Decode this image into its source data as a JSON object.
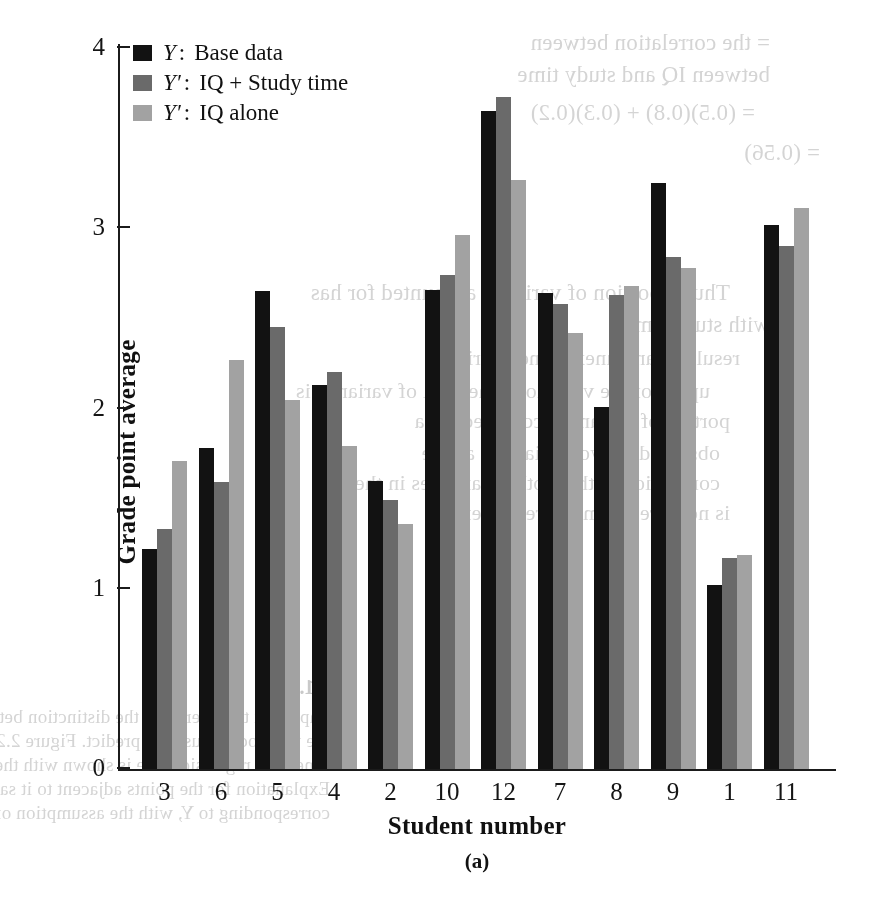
{
  "chart_data": {
    "type": "bar",
    "title": "",
    "panel_caption": "(a)",
    "xlabel": "Student number",
    "ylabel": "Grade point average",
    "categories": [
      "3",
      "6",
      "5",
      "4",
      "2",
      "10",
      "12",
      "7",
      "8",
      "9",
      "1",
      "11"
    ],
    "ylim": [
      0,
      4
    ],
    "yticks": [
      "0",
      "1",
      "2",
      "3",
      "4"
    ],
    "grid": false,
    "legend_position": "top-left",
    "series": [
      {
        "name": "Y: Base data",
        "key": "Y",
        "label": "Base data",
        "color": "#121212",
        "values": [
          1.22,
          1.78,
          2.65,
          2.13,
          1.6,
          2.66,
          3.65,
          2.64,
          2.01,
          3.25,
          1.02,
          3.02
        ]
      },
      {
        "name": "Y': IQ + Study time",
        "key": "Y'",
        "label": "IQ + Study time",
        "color": "#6a6a6a",
        "values": [
          1.33,
          1.59,
          2.45,
          2.2,
          1.49,
          2.74,
          3.73,
          2.58,
          2.63,
          2.84,
          1.17,
          2.9
        ]
      },
      {
        "name": "Y': IQ alone",
        "key": "Y'",
        "label": "IQ alone",
        "color": "#a2a2a2",
        "values": [
          1.71,
          2.27,
          2.05,
          1.79,
          1.36,
          2.96,
          3.27,
          2.42,
          2.68,
          2.78,
          1.19,
          3.11
        ]
      }
    ]
  },
  "legend": {
    "items": [
      {
        "key": "Y",
        "colon": ":",
        "label": "Base data",
        "swatch_class": "sw0"
      },
      {
        "key": "Y′",
        "colon": ":",
        "label": "IQ + Study time",
        "swatch_class": "sw1"
      },
      {
        "key": "Y′",
        "colon": ":",
        "label": "IQ alone",
        "swatch_class": "sw2"
      }
    ]
  },
  "bleed_text": {
    "lines": [
      "= the correlation between",
      "between IQ and study time",
      "= (0.5)(0.8) + (0.3)(0.2)",
      "= (0.56)",
      "Thus a portion of variance accounted for has",
      "with study time.",
      "resulting and unexplained vari",
      "upon for the variation. The total of variance is",
      "portion of variance accounted for a",
      "observed is two deviations above",
      "correlation with an other variables in the",
      "is not directly measured when a",
      "2.1.4 ...",
      "important to understand the distinction between the predicted",
      "the the model is used to predict. Figure 2.2 is a plot of the fitted",
      "time. The regression line is shown with the data. The relation may more",
      "Explanation for the points adjacent to it say must have been scored (i.e.,",
      "corresponding to Y, with the assumption of 2 points or higher with study"
    ]
  }
}
